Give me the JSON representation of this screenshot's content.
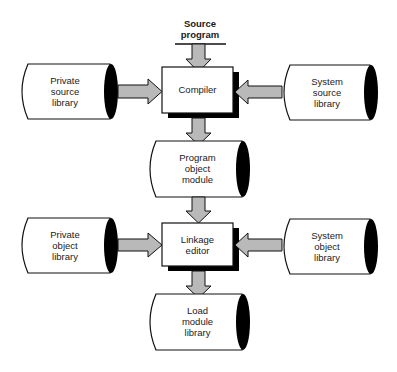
{
  "diagram": {
    "colors": {
      "arrow_fill": "#b9b9b9",
      "stroke": "#111111",
      "shadow": "#000000",
      "background": "#ffffff"
    },
    "input": {
      "line1": "Source",
      "line2": "program"
    },
    "processes": {
      "compiler": {
        "line1": "Compiler"
      },
      "linkage_editor": {
        "line1": "Linkage",
        "line2": "editor"
      }
    },
    "stores": {
      "private_source_library": {
        "line1": "Private",
        "line2": "source",
        "line3": "library"
      },
      "system_source_library": {
        "line1": "System",
        "line2": "source",
        "line3": "library"
      },
      "program_object_module": {
        "line1": "Program",
        "line2": "object",
        "line3": "module"
      },
      "private_object_library": {
        "line1": "Private",
        "line2": "object",
        "line3": "library"
      },
      "system_object_library": {
        "line1": "System",
        "line2": "object",
        "line3": "library"
      },
      "load_module_library": {
        "line1": "Load",
        "line2": "module",
        "line3": "library"
      }
    },
    "edges": [
      {
        "from": "Source program",
        "to": "Compiler"
      },
      {
        "from": "Private source library",
        "to": "Compiler"
      },
      {
        "from": "System source library",
        "to": "Compiler"
      },
      {
        "from": "Compiler",
        "to": "Program object module"
      },
      {
        "from": "Program object module",
        "to": "Linkage editor"
      },
      {
        "from": "Private object library",
        "to": "Linkage editor"
      },
      {
        "from": "System object library",
        "to": "Linkage editor"
      },
      {
        "from": "Linkage editor",
        "to": "Load module library"
      }
    ]
  }
}
